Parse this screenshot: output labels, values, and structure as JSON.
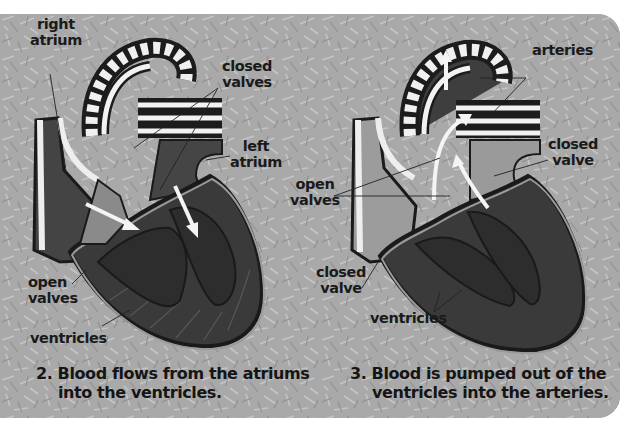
{
  "figure": {
    "background_color": "#a9a9a9",
    "heart_dark": "#3a3a3a",
    "heart_mid": "#8a8a8a",
    "vessel_white": "#f2f2f2",
    "panel_2": {
      "number": "2.",
      "caption_line1": "Blood flows from the atriums",
      "caption_line2": "into the ventricles.",
      "labels": {
        "right_atrium": [
          "right",
          "atrium"
        ],
        "closed_valves": [
          "closed",
          "valves"
        ],
        "left_atrium": [
          "left",
          "atrium"
        ],
        "open_valves": [
          "open",
          "valves"
        ],
        "ventricles": "ventricles"
      }
    },
    "panel_3": {
      "number": "3.",
      "caption_line1": "Blood is pumped out of the",
      "caption_line2": "ventricles into the arteries.",
      "labels": {
        "arteries": "arteries",
        "closed_valve_top": [
          "closed",
          "valve"
        ],
        "open_valves": [
          "open",
          "valves"
        ],
        "closed_valve_bottom": [
          "closed",
          "valve"
        ],
        "ventricles": "ventricles"
      }
    }
  }
}
